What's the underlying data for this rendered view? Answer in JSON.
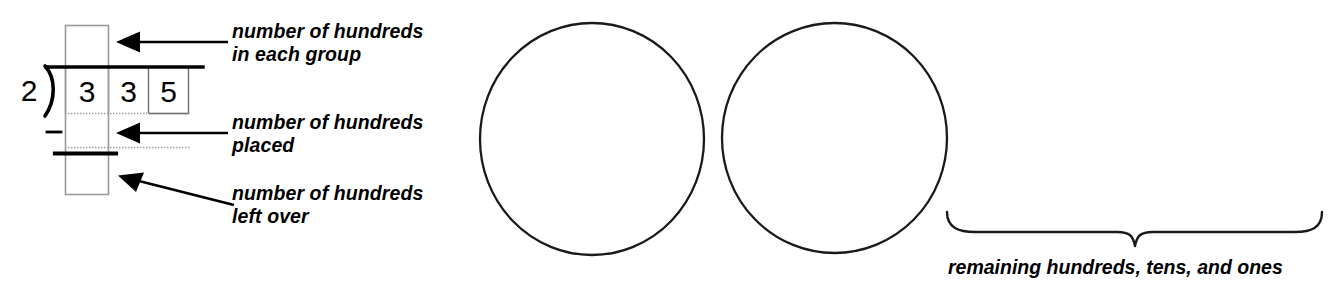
{
  "diagram": {
    "ink_color": "#000000",
    "guide_color": "#9a9a9a",
    "background": "#ffffff"
  },
  "division": {
    "divisor": "2",
    "dividend_digits": [
      "3",
      "3",
      "5"
    ],
    "operator_sign": "–",
    "bracket_icon": "division-bracket",
    "quotient_digits": [],
    "subtraction_result": []
  },
  "callouts": [
    {
      "id": "hundreds-in-each-group",
      "text": "number of hundreds\nin each group",
      "arrow": "arrow-left"
    },
    {
      "id": "hundreds-placed",
      "text": "number of hundreds\nplaced",
      "arrow": "arrow-left"
    },
    {
      "id": "hundreds-left-over",
      "text": "number of hundreds\nleft over",
      "arrow": "arrow-left-up"
    }
  ],
  "groups": {
    "circle_count": 2,
    "circles": [
      {
        "id": "group-circle-1",
        "label": ""
      },
      {
        "id": "group-circle-2",
        "label": ""
      }
    ]
  },
  "brace": {
    "icon": "curly-brace-bottom",
    "caption": "remaining hundreds, tens, and ones"
  }
}
